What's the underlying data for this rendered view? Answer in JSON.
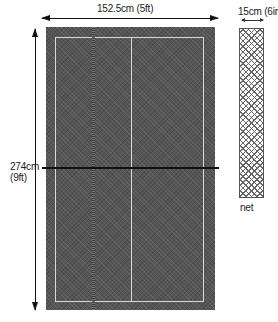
{
  "diagram": {
    "width_label": "152.5cm (5ft)",
    "length_label_line1": "274cm",
    "length_label_line2": "(9ft)",
    "net_height_label": "15cm (6ins)",
    "net_label": "net",
    "colors": {
      "table_surface": "#555555",
      "lines": "#d8d8d8",
      "net_line": "#111111",
      "background": "#ffffff"
    }
  }
}
